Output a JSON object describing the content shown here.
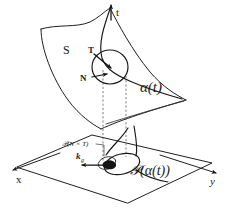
{
  "figure": {
    "kind": "differential-geometry-diagram",
    "background_color": "#ffffff",
    "ink_color": "#1a1a1a",
    "dashed_color": "#555555",
    "width": 231,
    "height": 214
  },
  "labels": {
    "surface": "S",
    "vertical_axis": "t",
    "tangent_vector": "T",
    "normal_vector": "N",
    "curve": "α(t)",
    "projected_curve": "𝒫(α(t))",
    "projected_frame": "𝒫(N × T)",
    "geodesic_curvature": "k",
    "geodesic_curvature_subscript": "g",
    "axis_x": "x",
    "axis_y": "y"
  },
  "elements": {
    "surface_patch": "curved-quadrilateral-surface",
    "base_plane": "xy-plane-parallelogram",
    "osculating_circle": "osculating-circle",
    "projection_lines": "vertical-dashed-projection-lines",
    "space_curve": "alpha-curve-on-surface",
    "plane_curve": "projected-curve-loop"
  }
}
